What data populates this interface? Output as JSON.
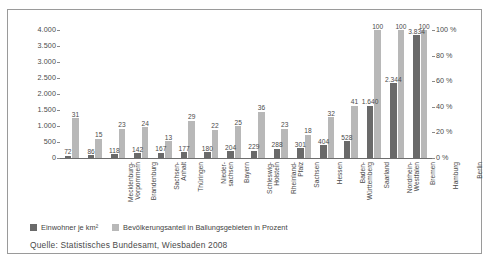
{
  "chart_data": {
    "type": "bar",
    "title": "",
    "xlabel": "",
    "ylabel": "",
    "categories": [
      "Mecklenburg-\nVorpommern",
      "Brandenburg",
      "Sachsen-\nAnhalt",
      "Thüringen",
      "Nieder-\nsachsen",
      "Bayern",
      "Schleswig-\nHolstein",
      "Rheinland-\nPfalz",
      "Sachsen",
      "Hessen",
      "Baden-\nWürttemberg",
      "Saarland",
      "Nordrhein-\nWestfalen",
      "Bremen",
      "Hamburg",
      "Berlin"
    ],
    "series": [
      {
        "name": "Einwohner je km²",
        "color": "#6a6a6a",
        "axis": "left",
        "values": [
          72,
          86,
          118,
          142,
          167,
          177,
          180,
          204,
          229,
          288,
          301,
          404,
          528,
          1640,
          2344,
          3834
        ],
        "labels": [
          "72",
          "86",
          "118",
          "142",
          "167",
          "177",
          "180",
          "204",
          "229",
          "288",
          "301",
          "404",
          "528",
          "1.640",
          "2.344",
          "3.834"
        ]
      },
      {
        "name": "Bevölkerungsanteil in Ballungsgebieten in Prozent",
        "color": "#b8b8b8",
        "axis": "right",
        "values": [
          31,
          15,
          23,
          24,
          13,
          29,
          22,
          25,
          36,
          23,
          18,
          32,
          41,
          100,
          100,
          100
        ],
        "labels": [
          "31",
          "15",
          "23",
          "24",
          "13",
          "29",
          "22",
          "25",
          "36",
          "23",
          "18",
          "32",
          "41",
          "100",
          "100",
          "100"
        ]
      }
    ],
    "y_left": {
      "min": 0,
      "max": 4000,
      "ticks": [
        0,
        500,
        1000,
        1500,
        2000,
        2500,
        3000,
        3500,
        4000
      ],
      "tick_labels": [
        "0",
        "500",
        "1.000",
        "1.500",
        "2.000",
        "2.500",
        "3.000",
        "3.500",
        "4.000"
      ]
    },
    "y_right": {
      "min": 0,
      "max": 100,
      "ticks": [
        0,
        20,
        40,
        60,
        80,
        100
      ],
      "tick_labels": [
        "0 %",
        "20 %",
        "40 %",
        "60 %",
        "80 %",
        "100 %"
      ]
    },
    "grid": false,
    "legend_position": "bottom-left"
  },
  "legend": {
    "items": [
      {
        "label": "Einwohner je km²",
        "swatch": "dark"
      },
      {
        "label": "Bevölkerungsanteil in Ballungsgebieten in Prozent",
        "swatch": "light"
      }
    ]
  },
  "source": {
    "text": "Quelle: Statistisches Bundesamt, Wiesbaden 2008"
  },
  "colors": {
    "dark_bar": "#6a6a6a",
    "light_bar": "#b8b8b8",
    "axis": "#6d6d6d",
    "border": "#9a9a9a",
    "text": "#4a4a4a"
  }
}
